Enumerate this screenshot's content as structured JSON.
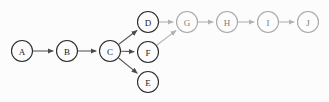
{
  "diagram": {
    "type": "directed-graph",
    "background_color": "#fcfcfc",
    "node_radius": 10.5,
    "colors": {
      "node_stroke_dark": "#2b2b2b",
      "node_stroke_light": "#a8a8a8",
      "node_fill": "#fcfcfc",
      "label_dark": "#222222",
      "label_light": "#7d7d7d",
      "edge_dark": "#5a5a5a",
      "edge_light": "#b2b2b2"
    },
    "nodes": [
      {
        "id": "A",
        "label": "A",
        "x": 22,
        "y": 51,
        "shade": "dark"
      },
      {
        "id": "B",
        "label": "B",
        "x": 67,
        "y": 51,
        "shade": "dark"
      },
      {
        "id": "C",
        "label": "C",
        "x": 110,
        "y": 51,
        "shade": "dark"
      },
      {
        "id": "D",
        "label": "D",
        "x": 148,
        "y": 22,
        "shade": "dark"
      },
      {
        "id": "F",
        "label": "F",
        "x": 148,
        "y": 52,
        "shade": "dark"
      },
      {
        "id": "E",
        "label": "E",
        "x": 148,
        "y": 82,
        "shade": "dark"
      },
      {
        "id": "G",
        "label": "G",
        "x": 187,
        "y": 22,
        "shade": "light"
      },
      {
        "id": "H",
        "label": "H",
        "x": 227,
        "y": 22,
        "shade": "light"
      },
      {
        "id": "I",
        "label": "I",
        "x": 268,
        "y": 22,
        "shade": "light"
      },
      {
        "id": "J",
        "label": "J",
        "x": 308,
        "y": 22,
        "shade": "light"
      }
    ],
    "edges": [
      {
        "from": "A",
        "to": "B",
        "shade": "dark"
      },
      {
        "from": "B",
        "to": "C",
        "shade": "dark"
      },
      {
        "from": "C",
        "to": "D",
        "shade": "dark"
      },
      {
        "from": "C",
        "to": "F",
        "shade": "dark"
      },
      {
        "from": "C",
        "to": "E",
        "shade": "dark"
      },
      {
        "from": "D",
        "to": "G",
        "shade": "light"
      },
      {
        "from": "F",
        "to": "G",
        "shade": "light"
      },
      {
        "from": "G",
        "to": "H",
        "shade": "light"
      },
      {
        "from": "H",
        "to": "I",
        "shade": "light"
      },
      {
        "from": "I",
        "to": "J",
        "shade": "light"
      }
    ]
  }
}
